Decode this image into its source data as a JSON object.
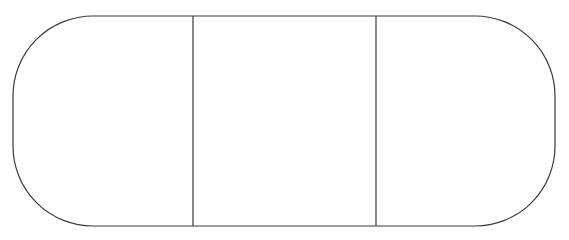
{
  "diagram": {
    "shape": "rounded-rectangle-divided-into-three-sections",
    "stroke_color": "#3a3a3a",
    "fill_color": "#ffffff",
    "sections": [
      {
        "id": "left",
        "label": ""
      },
      {
        "id": "middle",
        "label": ""
      },
      {
        "id": "right",
        "label": ""
      }
    ]
  }
}
